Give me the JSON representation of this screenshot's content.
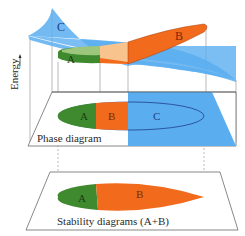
{
  "axis": {
    "label": "Energy"
  },
  "energy_surfaces": {
    "c_label": "C",
    "a_label": "A",
    "b_label": "B"
  },
  "phase_diagram": {
    "title": "Phase diagram",
    "regions": {
      "a": "A",
      "b": "B",
      "c": "C"
    }
  },
  "stability_diagram": {
    "title": "Stability diagrams (A+B)",
    "regions": {
      "a": "A",
      "b": "B"
    }
  },
  "colors": {
    "green": "#3f8a2f",
    "light_green": "#9cc67c",
    "orange": "#f26a1b",
    "light_orange": "#f8c38c",
    "blue": "#5aaef0",
    "text_blue": "#1f3c88",
    "text_dark": "#2a2a2a",
    "line": "#555555"
  }
}
